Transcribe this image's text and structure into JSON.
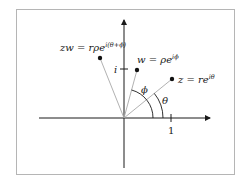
{
  "diagram": {
    "labels": {
      "zw": "zw = rρe",
      "zw_exp": "i(θ+ϕ)",
      "w": "w = ρe",
      "w_exp": "iϕ",
      "z": "z = re",
      "z_exp": "iθ",
      "phi": "ϕ",
      "theta": "θ",
      "tick_real": "1",
      "tick_imag": "i"
    },
    "colors": {
      "axis": "#1a1a1a",
      "ray": "#a8a8a8",
      "point": "#111111",
      "frame": "#b5b5b5"
    },
    "points": [
      {
        "name": "zw",
        "x": 100,
        "y": 58
      },
      {
        "name": "w",
        "x": 137,
        "y": 70
      },
      {
        "name": "z",
        "x": 172,
        "y": 79
      }
    ],
    "origin": {
      "x": 124,
      "y": 118
    }
  }
}
